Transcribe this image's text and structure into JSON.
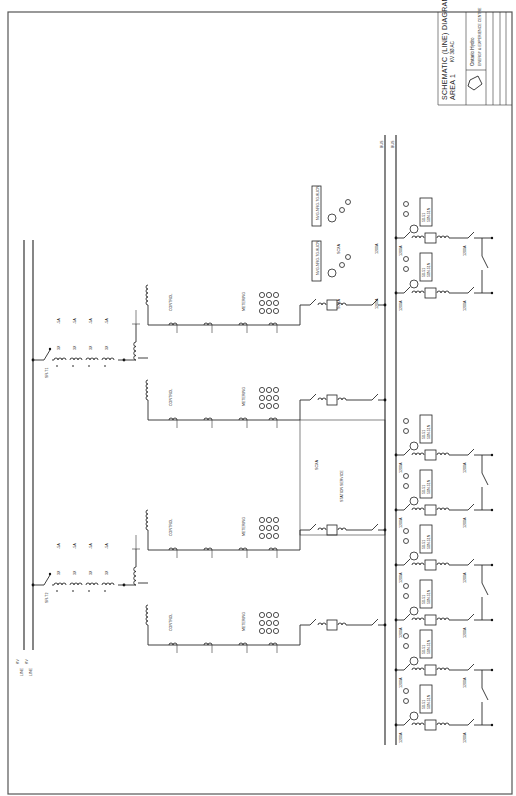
{
  "title_block": {
    "title_line1": "SCHEMATIC (LINE) DIAGRAM",
    "title_line2": "KV 3Ø AC",
    "area": "AREA 1",
    "company": "Ontario Hydro",
    "company_sub": "ENERGY & EXPERIENCE CENTRE"
  },
  "incoming_lines": [
    {
      "kv": "KV",
      "label": "LINE"
    },
    {
      "kv": "KV",
      "label": "LINE"
    }
  ],
  "line_transformers": [
    {
      "id": "SR-T1",
      "ct_labels": [
        "3X",
        "3X",
        "3X",
        "3X"
      ],
      "ratio_labels": [
        "-5A",
        "-5A",
        "-5A",
        "-5A"
      ]
    },
    {
      "id": "SR-T2",
      "ct_labels": [
        "3X",
        "3X",
        "3X",
        "3X"
      ],
      "ratio_labels": [
        "-5A",
        "-5A",
        "-5A",
        "-5A"
      ]
    }
  ],
  "bus_labels": [
    "BUS",
    "BUS"
  ],
  "station_service": {
    "label": "STATION SERVICE",
    "tag": "SCXA"
  },
  "feeders_upper": [
    {
      "tag": "NVG-NRG-7G-8L",
      "suffix": "ICN",
      "breaker": "SCXA",
      "rating": "1200A"
    },
    {
      "tag": "NVG-NRG-7G-8L",
      "suffix": "ICN",
      "breaker": "SCXA",
      "rating": "1200A"
    }
  ],
  "feeder_ratings": [
    "1200A",
    "1200A",
    "1200A",
    "1200A",
    "1200A",
    "1200A",
    "1200A",
    "1200A",
    "1200A",
    "1200A"
  ],
  "relay_block_labels": [
    "50-51",
    "50N-51N",
    "87B"
  ],
  "control_labels": [
    "CONTROL",
    "METERING"
  ]
}
